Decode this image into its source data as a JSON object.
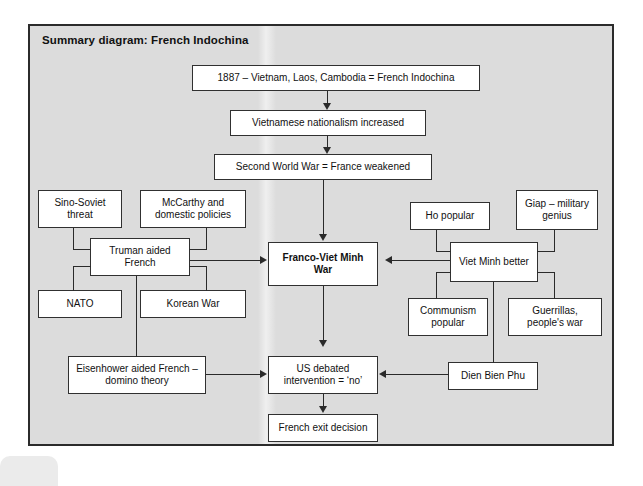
{
  "panel": {
    "title": "Summary diagram: French Indochina",
    "background_color": "#dcdcdc",
    "border_color": "#2b2b2b",
    "box_fill": "#ffffff",
    "line_color": "#2a2a2a"
  },
  "diagram": {
    "type": "flowchart",
    "nodes": [
      {
        "id": "indochina",
        "label": "1887 – Vietnam, Laos, Cambodia = French Indochina",
        "emphasis": "normal"
      },
      {
        "id": "nationalism",
        "label": "Vietnamese nationalism increased",
        "emphasis": "normal"
      },
      {
        "id": "wwii",
        "label": "Second World War = France weakened",
        "emphasis": "normal"
      },
      {
        "id": "sino",
        "label": "Sino-Soviet threat",
        "emphasis": "normal"
      },
      {
        "id": "mccarthy",
        "label": "McCarthy and domestic policies",
        "emphasis": "normal"
      },
      {
        "id": "truman",
        "label": "Truman aided French",
        "emphasis": "normal"
      },
      {
        "id": "nato",
        "label": "NATO",
        "emphasis": "normal"
      },
      {
        "id": "korea",
        "label": "Korean War",
        "emphasis": "normal"
      },
      {
        "id": "war",
        "label": "Franco-Viet Minh War",
        "emphasis": "bold"
      },
      {
        "id": "ho",
        "label": "Ho popular",
        "emphasis": "normal"
      },
      {
        "id": "giap",
        "label": "Giap – military genius",
        "emphasis": "normal"
      },
      {
        "id": "vietminh",
        "label": "Viet Minh better",
        "emphasis": "normal"
      },
      {
        "id": "communism",
        "label": "Communism popular",
        "emphasis": "normal"
      },
      {
        "id": "guerrillas",
        "label": "Guerrillas, people's war",
        "emphasis": "normal"
      },
      {
        "id": "eisenhower",
        "label": "Eisenhower aided French – domino theory",
        "emphasis": "normal"
      },
      {
        "id": "usdebated",
        "label": "US debated intervention = ‘no’",
        "emphasis": "normal"
      },
      {
        "id": "dienbienphu",
        "label": "Dien Bien Phu",
        "emphasis": "normal"
      },
      {
        "id": "frenchexit",
        "label": "French exit decision",
        "emphasis": "normal"
      }
    ],
    "edges": [
      {
        "from": "indochina",
        "to": "nationalism",
        "kind": "arrow-down"
      },
      {
        "from": "nationalism",
        "to": "wwii",
        "kind": "arrow-down"
      },
      {
        "from": "wwii",
        "to": "war",
        "kind": "arrow-down"
      },
      {
        "from": "sino",
        "to": "truman",
        "kind": "elbow"
      },
      {
        "from": "mccarthy",
        "to": "truman",
        "kind": "elbow"
      },
      {
        "from": "nato",
        "to": "truman",
        "kind": "elbow"
      },
      {
        "from": "korea",
        "to": "truman",
        "kind": "elbow"
      },
      {
        "from": "truman",
        "to": "war",
        "kind": "arrow-right"
      },
      {
        "from": "truman",
        "to": "eisenhower",
        "kind": "line-down"
      },
      {
        "from": "ho",
        "to": "vietminh",
        "kind": "elbow"
      },
      {
        "from": "giap",
        "to": "vietminh",
        "kind": "elbow"
      },
      {
        "from": "communism",
        "to": "vietminh",
        "kind": "elbow"
      },
      {
        "from": "guerrillas",
        "to": "vietminh",
        "kind": "elbow"
      },
      {
        "from": "vietminh",
        "to": "war",
        "kind": "arrow-left"
      },
      {
        "from": "vietminh",
        "to": "dienbienphu",
        "kind": "line-down"
      },
      {
        "from": "war",
        "to": "usdebated",
        "kind": "arrow-down"
      },
      {
        "from": "eisenhower",
        "to": "usdebated",
        "kind": "arrow-right"
      },
      {
        "from": "dienbienphu",
        "to": "usdebated",
        "kind": "arrow-left"
      },
      {
        "from": "usdebated",
        "to": "frenchexit",
        "kind": "arrow-down"
      }
    ]
  }
}
